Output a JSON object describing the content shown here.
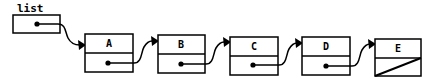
{
  "diagram": {
    "head_variable": {
      "label": "list",
      "points_to": "A"
    },
    "nodes": [
      {
        "id": "A",
        "value": "A",
        "next": "B"
      },
      {
        "id": "B",
        "value": "B",
        "next": "C"
      },
      {
        "id": "C",
        "value": "C",
        "next": "D"
      },
      {
        "id": "D",
        "value": "D",
        "next": "E"
      },
      {
        "id": "E",
        "value": "E",
        "next": null
      }
    ],
    "null_marker": "diagonal-slash",
    "colors": {
      "stroke": "#000000",
      "fill": "#ffffff"
    }
  }
}
